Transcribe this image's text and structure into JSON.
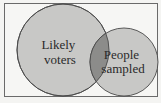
{
  "diagram": {
    "type": "venn",
    "sets": [
      {
        "id": "likely-voters",
        "label_lines": [
          "Likely",
          "voters"
        ]
      },
      {
        "id": "people-sampled",
        "label_lines": [
          "People",
          "sampled"
        ]
      }
    ],
    "intersection_highlighted": true,
    "colors": {
      "background": "#f4f4f2",
      "frame": "#6a6a6a",
      "circle_fill": "#c8c8c6",
      "circle_stroke": "#4a4a4a",
      "intersection_fill": "#8c8c8a",
      "text": "#2a2a2a"
    }
  }
}
